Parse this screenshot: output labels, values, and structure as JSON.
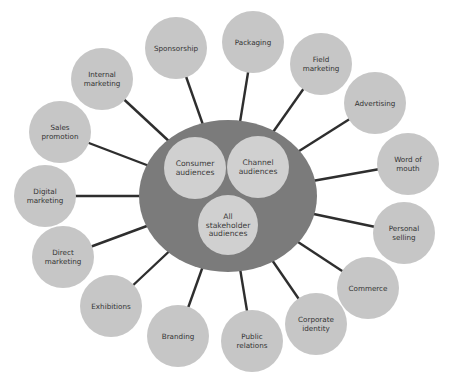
{
  "diagram": {
    "colors": {
      "background": "#ffffff",
      "hub_fill": "#7b7b7b",
      "inner_fill": "#d0d0d0",
      "node_fill": "#c6c6c6",
      "connector": "#2e2e2e",
      "text": "#333333"
    },
    "hub": {
      "cx": 228,
      "cy": 196,
      "rx": 89,
      "ry": 76,
      "inner": [
        {
          "id": "consumer",
          "lines": [
            "Consumer",
            "audiences"
          ],
          "cx": 195,
          "cy": 168,
          "r": 31
        },
        {
          "id": "channel",
          "lines": [
            "Channel",
            "audiences"
          ],
          "cx": 258,
          "cy": 167,
          "r": 31
        },
        {
          "id": "all-stakeholder",
          "lines": [
            "All",
            "stakeholder",
            "audiences"
          ],
          "cx": 228,
          "cy": 225,
          "r": 30
        }
      ]
    },
    "nodes": [
      {
        "id": "sponsorship",
        "lines": [
          "Sponsorship"
        ],
        "cx": 176,
        "cy": 48,
        "r": 31
      },
      {
        "id": "packaging",
        "lines": [
          "Packaging"
        ],
        "cx": 253,
        "cy": 42,
        "r": 31
      },
      {
        "id": "field-marketing",
        "lines": [
          "Field",
          "marketing"
        ],
        "cx": 321,
        "cy": 64,
        "r": 31
      },
      {
        "id": "advertising",
        "lines": [
          "Advertising"
        ],
        "cx": 375,
        "cy": 103,
        "r": 31
      },
      {
        "id": "word-of-mouth",
        "lines": [
          "Word of",
          "mouth"
        ],
        "cx": 408,
        "cy": 164,
        "r": 31
      },
      {
        "id": "personal-selling",
        "lines": [
          "Personal",
          "selling"
        ],
        "cx": 404,
        "cy": 233,
        "r": 31
      },
      {
        "id": "commerce",
        "lines": [
          "Commerce"
        ],
        "cx": 368,
        "cy": 288,
        "r": 31
      },
      {
        "id": "corporate-identity",
        "lines": [
          "Corporate",
          "identity"
        ],
        "cx": 316,
        "cy": 324,
        "r": 31
      },
      {
        "id": "public-relations",
        "lines": [
          "Public",
          "relations"
        ],
        "cx": 252,
        "cy": 341,
        "r": 31
      },
      {
        "id": "branding",
        "lines": [
          "Branding"
        ],
        "cx": 178,
        "cy": 336,
        "r": 31
      },
      {
        "id": "exhibitions",
        "lines": [
          "Exhibitions"
        ],
        "cx": 111,
        "cy": 306,
        "r": 31
      },
      {
        "id": "direct-marketing",
        "lines": [
          "Direct",
          "marketing"
        ],
        "cx": 63,
        "cy": 257,
        "r": 31
      },
      {
        "id": "digital-marketing",
        "lines": [
          "Digital",
          "marketing"
        ],
        "cx": 45,
        "cy": 196,
        "r": 31
      },
      {
        "id": "sales-promotion",
        "lines": [
          "Sales",
          "promotion"
        ],
        "cx": 60,
        "cy": 132,
        "r": 31
      },
      {
        "id": "internal-marketing",
        "lines": [
          "Internal",
          "marketing"
        ],
        "cx": 102,
        "cy": 79,
        "r": 31
      }
    ]
  }
}
